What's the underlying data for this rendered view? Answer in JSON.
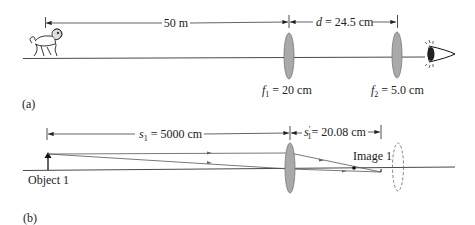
{
  "panel_a": {
    "label": "(a)",
    "distance_label": "50 m",
    "separation_prefix": "d",
    "separation_value": "= 24.5 cm",
    "lens1": {
      "f_symbol": "f",
      "f_subscript": "1",
      "f_value": "= 20 cm"
    },
    "lens2": {
      "f_symbol": "f",
      "f_subscript": "2",
      "f_value": "= 5.0 cm"
    },
    "object_icon": "lion-icon",
    "observer_icon": "eye-icon"
  },
  "panel_b": {
    "label": "(b)",
    "object_distance": {
      "symbol": "s",
      "subscript": "1",
      "value": "= 5000 cm"
    },
    "image_distance": {
      "symbol": "s",
      "prime": "′",
      "subscript": "1",
      "value": "= 20.08 cm"
    },
    "object_label": "Object 1",
    "image_label": "Image 1"
  },
  "colors": {
    "line": "#333333",
    "lens_fill": "#a9a9a9",
    "lens_stroke": "#777777",
    "ray": "#555555"
  }
}
